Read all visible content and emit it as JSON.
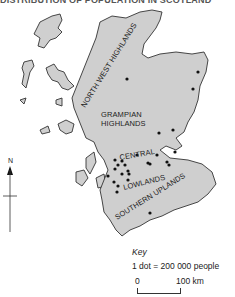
{
  "title": "DISTRIBUTION OF POPULATION IN SCOTLAND",
  "regions": {
    "north_west_highlands": "NORTH WEST HIGHLANDS",
    "grampian_line1": "GRAMPIAN",
    "grampian_line2": "HIGHLANDS",
    "central": "CENTRAL",
    "lowlands": "LOWLANDS",
    "southern_uplands": "SOUTHERN UPLANDS"
  },
  "north_arrow": {
    "label": "N"
  },
  "key": {
    "title": "Key",
    "legend": "1 dot = 200 000 people",
    "scale_start": "0",
    "scale_end": "100 km"
  },
  "colors": {
    "land": "#cfcfcf",
    "outline": "#333333",
    "dot": "#111111"
  },
  "population_dots": 26
}
